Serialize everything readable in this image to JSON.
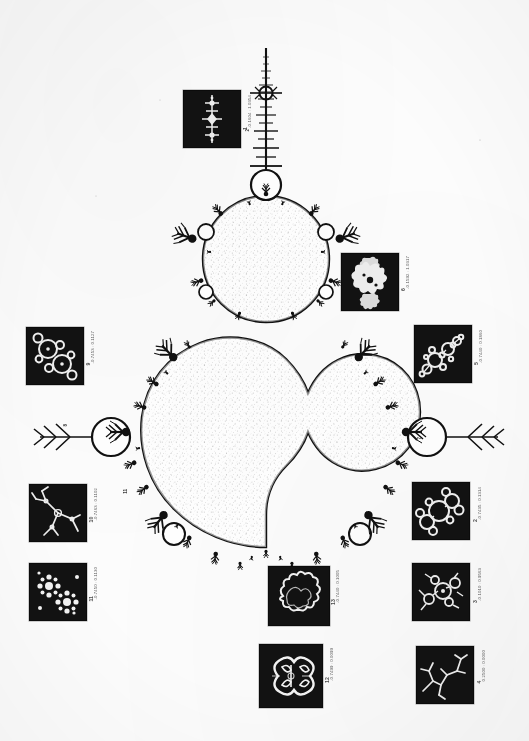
{
  "figure": {
    "orientation": "page rotated 90 degrees (antenna spike points up)",
    "background_color": "#fcfcfc",
    "ink_color": "#111111",
    "inset_background": "#121212",
    "inset_ink": "#f2f2f2"
  },
  "insets": [
    {
      "id": "inset-1",
      "number": "1",
      "coord": "-0.1604 : 1.0354",
      "detail": "vertical-chain",
      "x": 183,
      "y": 90,
      "w": 56,
      "h": 56
    },
    {
      "id": "inset-2",
      "number": "2",
      "coord": "-0.7435 : 0.1314",
      "detail": "branch-spiral",
      "x": 412,
      "y": 482,
      "w": 56,
      "h": 56
    },
    {
      "id": "inset-3",
      "number": "3",
      "coord": "-0.1010 : 0.9563",
      "detail": "twin-bulbs",
      "x": 412,
      "y": 563,
      "w": 56,
      "h": 56
    },
    {
      "id": "inset-4",
      "number": "4",
      "coord": "0.2500 : 0.0000",
      "detail": "thin-dendrite",
      "x": 416,
      "y": 646,
      "w": 56,
      "h": 56
    },
    {
      "id": "inset-5",
      "number": "5",
      "coord": "-0.7440 : 0.1860",
      "detail": "bead-chain",
      "x": 414,
      "y": 325,
      "w": 56,
      "h": 56
    },
    {
      "id": "inset-6",
      "number": "6",
      "coord": "-0.1592 : 1.0317",
      "detail": "four-lobe-cross",
      "x": 341,
      "y": 253,
      "w": 56,
      "h": 56
    },
    {
      "id": "inset-7",
      "number": "7",
      "coord": "-0.7470 : 0.1030",
      "detail": "bulb-cluster",
      "x": 416,
      "y": 646,
      "w": 0,
      "h": 0
    },
    {
      "id": "inset-8",
      "number": "8",
      "coord": "-1.2500 : 0.0000",
      "detail": "left-disk-marker",
      "x": 0,
      "y": 0,
      "w": 0,
      "h": 0
    },
    {
      "id": "inset-9",
      "number": "9",
      "coord": "-0.7453 : 0.1127",
      "detail": "double-bulb",
      "x": 26,
      "y": 327,
      "w": 56,
      "h": 56
    },
    {
      "id": "inset-10",
      "number": "10",
      "coord": "-0.7463 : 0.1102",
      "detail": "tri-branch",
      "x": 29,
      "y": 484,
      "w": 56,
      "h": 56
    },
    {
      "id": "inset-11",
      "number": "11",
      "coord": "-0.7450 : 0.1130",
      "detail": "snowflake-pair",
      "x": 29,
      "y": 563,
      "w": 56,
      "h": 56
    },
    {
      "id": "inset-12",
      "number": "12",
      "coord": "-0.7499 : 0.0099",
      "detail": "double-scroll",
      "x": 259,
      "y": 644,
      "w": 62,
      "h": 62
    },
    {
      "id": "inset-13",
      "number": "13",
      "coord": "-0.7440 : 0.1005",
      "detail": "cloud-lobe",
      "x": 268,
      "y": 566,
      "w": 60,
      "h": 58
    }
  ],
  "labels": [
    {
      "for": "inset-1",
      "number": "1",
      "coord": "-0.1604 : 1.0354",
      "x": 243,
      "y": 95
    },
    {
      "for": "inset-6",
      "number": "6",
      "coord": "-0.1592 : 1.0317",
      "x": 401,
      "y": 256
    },
    {
      "for": "inset-5",
      "number": "5",
      "coord": "-0.7440 : 0.1860",
      "x": 474,
      "y": 330
    },
    {
      "for": "inset-2",
      "number": "2",
      "coord": "-0.7435 : 0.1314",
      "x": 473,
      "y": 487
    },
    {
      "for": "inset-3",
      "number": "3",
      "coord": "-0.1010 : 0.9563",
      "x": 473,
      "y": 568
    },
    {
      "for": "inset-4",
      "number": "4",
      "coord": "0.2500 : 0.0000",
      "x": 477,
      "y": 650
    },
    {
      "for": "inset-9",
      "number": "9",
      "coord": "-0.7453 : 0.1127",
      "x": 86,
      "y": 331
    },
    {
      "for": "inset-10",
      "number": "10",
      "coord": "-0.7463 : 0.1102",
      "x": 89,
      "y": 488
    },
    {
      "for": "inset-11",
      "number": "11",
      "coord": "-0.7450 : 0.1130",
      "x": 89,
      "y": 567
    },
    {
      "for": "inset-13",
      "number": "13",
      "coord": "-0.7440 : 0.1005",
      "x": 331,
      "y": 570
    },
    {
      "for": "inset-12",
      "number": "12",
      "coord": "-0.7499 : 0.0099",
      "x": 325,
      "y": 648
    }
  ],
  "markers": [
    {
      "id": "marker-8",
      "text": "8",
      "x": 63,
      "y": 424
    },
    {
      "id": "marker-7",
      "text": "7",
      "x": 417,
      "y": 437
    },
    {
      "id": "marker-11",
      "text": "11",
      "x": 123,
      "y": 489
    },
    {
      "id": "marker-2",
      "text": "2",
      "x": 245,
      "y": 129
    }
  ]
}
